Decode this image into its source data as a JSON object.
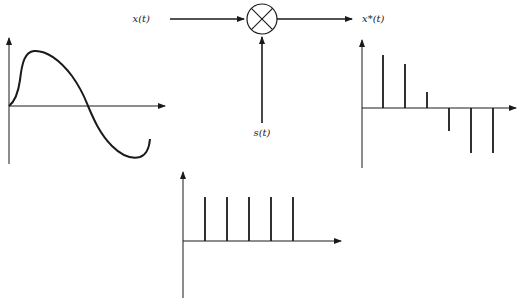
{
  "diagram": {
    "labels": {
      "input": "x(t)",
      "carrier": "s(t)",
      "output": "x*(t)"
    },
    "multiplier_symbol": "circle-cross"
  },
  "plots": {
    "continuous": {
      "name": "x(t) continuous signal",
      "shape": "sinusoid-like curve rising, then crossing zero and falling negative"
    },
    "sampled": {
      "name": "x*(t) sampled signal",
      "impulses": [
        0.88,
        0.72,
        0.22,
        -0.4,
        -0.75,
        -0.75
      ]
    },
    "impulse_train": {
      "name": "s(t) impulse train",
      "impulses": [
        1,
        1,
        1,
        1,
        1
      ]
    }
  },
  "colors": {
    "stroke": "#1a1a1a",
    "background": "#ffffff"
  }
}
